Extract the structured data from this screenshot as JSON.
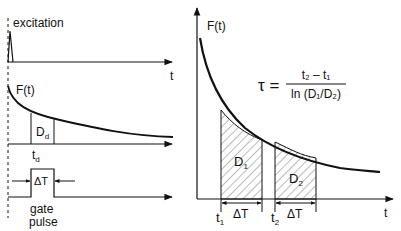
{
  "left_panel": {
    "excitation_label": "excitation",
    "t_axis_label_top": "t",
    "ft_label": "F(t)",
    "detected_area_label": "D",
    "detected_area_sub": "d",
    "delay_label": "t",
    "delay_sub": "d",
    "gate_width_label": "ΔT",
    "gate_label_line1": "gate",
    "gate_label_line2": "pulse"
  },
  "right_panel": {
    "ft_label": "F(t)",
    "t_axis_label": "t",
    "formula": {
      "lhs": "τ =",
      "numerator": "t₂ – t₁",
      "denominator": "ln (D₁/D₂)"
    },
    "area1_label": "D",
    "area1_sub": "1",
    "area2_label": "D",
    "area2_sub": "2",
    "t1_label": "t",
    "t1_sub": "1",
    "t2_label": "t",
    "t2_sub": "2",
    "gate1_width_label": "ΔT",
    "gate2_width_label": "ΔT"
  },
  "colors": {
    "stroke": "#111111",
    "hatch": "#555555",
    "background": "#ffffff"
  }
}
